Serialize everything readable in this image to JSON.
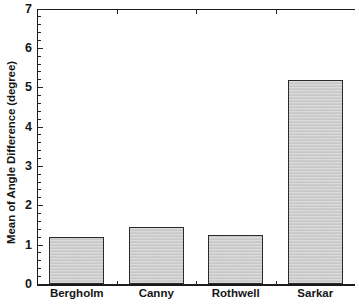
{
  "chart_data": {
    "type": "bar",
    "title": "",
    "xlabel": "",
    "ylabel": "Mean of Angle Difference (degree)",
    "categories": [
      "Bergholm",
      "Canny",
      "Rothwell",
      "Sarkar"
    ],
    "values": [
      1.2,
      1.45,
      1.25,
      5.2
    ],
    "ylim": [
      0,
      7
    ],
    "ytick_labels": [
      "0",
      "1",
      "2",
      "3",
      "4",
      "5",
      "6",
      "7"
    ],
    "ytick_values": [
      0,
      1,
      2,
      3,
      4,
      5,
      6,
      7
    ],
    "minor_tick_step": 0.2,
    "grid": false,
    "legend": null,
    "bar_fill_color": "#c9c9c9",
    "bar_edge_color": "#2a2a2a",
    "axis_color": "#1b1b1b",
    "background_color": "#ffffff"
  }
}
